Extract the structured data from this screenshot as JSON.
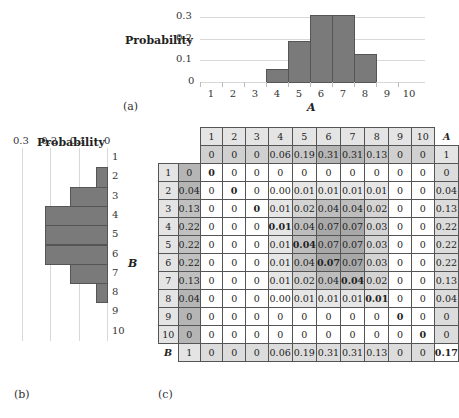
{
  "chart_data": [
    {
      "id": "a",
      "type": "bar",
      "panel_label": "(a)",
      "title": "",
      "xlabel": "A",
      "ylabel": "Probability",
      "categories": [
        "1",
        "2",
        "3",
        "4",
        "5",
        "6",
        "7",
        "8",
        "9",
        "10"
      ],
      "values": [
        0,
        0,
        0,
        0.06,
        0.19,
        0.31,
        0.31,
        0.13,
        0,
        0
      ],
      "yticks": [
        "0",
        "0.1",
        "0.2",
        "0.3"
      ],
      "ylim": [
        0,
        0.35
      ],
      "grid": true
    },
    {
      "id": "b",
      "type": "bar",
      "orientation": "horizontal-reversed",
      "panel_label": "(b)",
      "xlabel": "Probability",
      "ylabel": "B",
      "categories": [
        "1",
        "2",
        "3",
        "4",
        "5",
        "6",
        "7",
        "8",
        "9",
        "10"
      ],
      "values": [
        0,
        0.04,
        0.13,
        0.22,
        0.22,
        0.22,
        0.13,
        0.04,
        0,
        0
      ],
      "xticks": [
        "0.3",
        "0.2",
        "0.1",
        "0"
      ],
      "xlim": [
        0.3,
        0
      ],
      "grid": true
    },
    {
      "id": "c",
      "type": "table",
      "panel_label": "(c)",
      "col_headers": [
        "1",
        "2",
        "3",
        "4",
        "5",
        "6",
        "7",
        "8",
        "9",
        "10"
      ],
      "corner_A": "A",
      "corner_B": "B",
      "marginal_A": [
        "0",
        "0",
        "0",
        "0.06",
        "0.19",
        "0.31",
        "0.31",
        "0.13",
        "0",
        "0"
      ],
      "marginal_A_total": "1",
      "row_headers": [
        "1",
        "2",
        "3",
        "4",
        "5",
        "6",
        "7",
        "8",
        "9",
        "10"
      ],
      "marginal_B": [
        "0",
        "0.04",
        "0.13",
        "0.22",
        "0.22",
        "0.22",
        "0.13",
        "0.04",
        "0",
        "0"
      ],
      "marginal_B_total": "1",
      "cells": [
        [
          "0",
          "0",
          "0",
          "0",
          "0",
          "0",
          "0",
          "0",
          "0",
          "0"
        ],
        [
          "0",
          "0",
          "0",
          "0.00",
          "0.01",
          "0.01",
          "0.01",
          "0.01",
          "0",
          "0"
        ],
        [
          "0",
          "0",
          "0",
          "0.01",
          "0.02",
          "0.04",
          "0.04",
          "0.02",
          "0",
          "0"
        ],
        [
          "0",
          "0",
          "0",
          "0.01",
          "0.04",
          "0.07",
          "0.07",
          "0.03",
          "0",
          "0"
        ],
        [
          "0",
          "0",
          "0",
          "0.01",
          "0.04",
          "0.07",
          "0.07",
          "0.03",
          "0",
          "0"
        ],
        [
          "0",
          "0",
          "0",
          "0.01",
          "0.04",
          "0.07",
          "0.07",
          "0.03",
          "0",
          "0"
        ],
        [
          "0",
          "0",
          "0",
          "0.01",
          "0.02",
          "0.04",
          "0.04",
          "0.02",
          "0",
          "0"
        ],
        [
          "0",
          "0",
          "0",
          "0.00",
          "0.01",
          "0.01",
          "0.01",
          "0.01",
          "0",
          "0"
        ],
        [
          "0",
          "0",
          "0",
          "0",
          "0",
          "0",
          "0",
          "0",
          "0",
          "0"
        ],
        [
          "0",
          "0",
          "0",
          "0",
          "0",
          "0",
          "0",
          "0",
          "0",
          "0"
        ]
      ],
      "bold_cells": [
        [
          0,
          0
        ],
        [
          1,
          1
        ],
        [
          2,
          2
        ],
        [
          3,
          3
        ],
        [
          4,
          4
        ],
        [
          5,
          5
        ],
        [
          6,
          6
        ],
        [
          7,
          7
        ],
        [
          8,
          8
        ],
        [
          9,
          9
        ]
      ],
      "bottom_right": "0.17"
    }
  ]
}
